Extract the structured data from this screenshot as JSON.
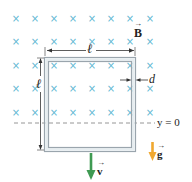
{
  "diagram": {
    "colors": {
      "field_marks": "#5fb8d3",
      "loop_outer": "#9aa5ad",
      "loop_fill": "#e9eff2",
      "dimension_lines": "#333333",
      "dashed_line": "#8a8a8a",
      "velocity_arrow": "#3f9a52",
      "gravity_arrow": "#f0a830",
      "text": "#222222"
    },
    "field": {
      "symbol": "×",
      "direction": "into page",
      "label": "B",
      "columns_x": [
        16,
        35,
        54,
        73,
        92,
        111,
        130,
        150
      ],
      "rows_y": [
        19,
        42,
        66,
        89,
        113
      ]
    },
    "loop": {
      "side_label": "ℓ",
      "thickness_label": "d"
    },
    "reference_line": {
      "label": "y = 0"
    },
    "velocity": {
      "label": "v"
    },
    "gravity": {
      "label": "g"
    }
  }
}
